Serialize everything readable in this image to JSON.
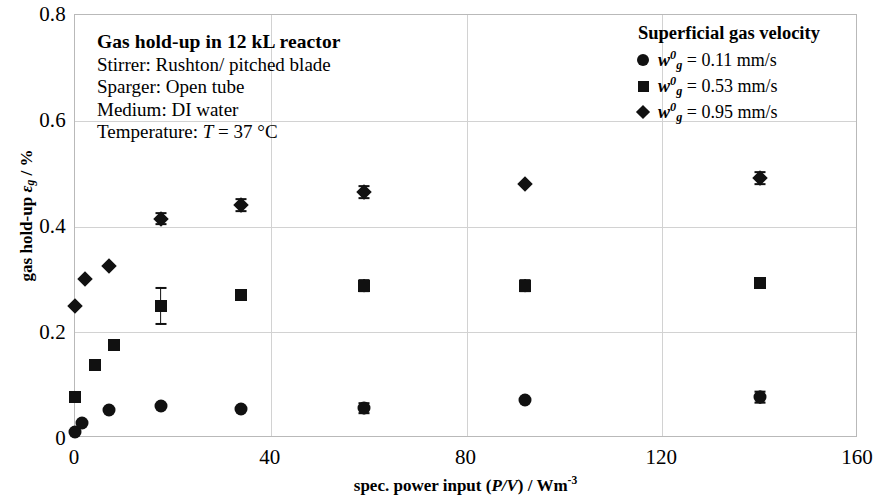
{
  "chart_data": {
    "type": "scatter",
    "title": "Gas hold-up in 12 kL reactor",
    "xlabel": "spec. power input (P/V) / Wm-3",
    "ylabel": "gas hold-up εg / %",
    "xlim": [
      0,
      160
    ],
    "ylim": [
      0,
      0.8
    ],
    "xticks": [
      "0",
      "40",
      "80",
      "120",
      "160"
    ],
    "yticks": [
      "0",
      "0.2",
      "0.4",
      "0.6",
      "0.8"
    ],
    "grid": true,
    "legend_position": "top-right",
    "series": [
      {
        "name": "wg0 = 0.11 mm/s",
        "marker": "circle",
        "color": "#111111",
        "points": [
          {
            "x": 0,
            "y": 0.012,
            "yerr": 0
          },
          {
            "x": 1.5,
            "y": 0.028,
            "yerr": 0
          },
          {
            "x": 7,
            "y": 0.053,
            "yerr": 0
          },
          {
            "x": 17.5,
            "y": 0.06,
            "yerr": 0
          },
          {
            "x": 34,
            "y": 0.054,
            "yerr": 0
          },
          {
            "x": 59,
            "y": 0.056,
            "yerr": 0.011
          },
          {
            "x": 92,
            "y": 0.072,
            "yerr": 0
          },
          {
            "x": 140,
            "y": 0.077,
            "yerr": 0.012
          }
        ]
      },
      {
        "name": "wg0 = 0.53 mm/s",
        "marker": "square",
        "color": "#111111",
        "points": [
          {
            "x": 0,
            "y": 0.078,
            "yerr": 0
          },
          {
            "x": 4,
            "y": 0.138,
            "yerr": 0
          },
          {
            "x": 8,
            "y": 0.175,
            "yerr": 0
          },
          {
            "x": 17.5,
            "y": 0.25,
            "yerr": 0.036
          },
          {
            "x": 34,
            "y": 0.27,
            "yerr": 0
          },
          {
            "x": 59,
            "y": 0.288,
            "yerr": 0.013
          },
          {
            "x": 92,
            "y": 0.288,
            "yerr": 0.013
          },
          {
            "x": 140,
            "y": 0.294,
            "yerr": 0
          }
        ]
      },
      {
        "name": "wg0 = 0.95 mm/s",
        "marker": "diamond",
        "color": "#111111",
        "points": [
          {
            "x": 0,
            "y": 0.25,
            "yerr": 0
          },
          {
            "x": 2,
            "y": 0.3,
            "yerr": 0
          },
          {
            "x": 7,
            "y": 0.325,
            "yerr": 0
          },
          {
            "x": 17.5,
            "y": 0.415,
            "yerr": 0.013
          },
          {
            "x": 34,
            "y": 0.44,
            "yerr": 0.013
          },
          {
            "x": 59,
            "y": 0.465,
            "yerr": 0.013
          },
          {
            "x": 92,
            "y": 0.48,
            "yerr": 0
          },
          {
            "x": 140,
            "y": 0.492,
            "yerr": 0.013
          }
        ]
      }
    ]
  },
  "annotation": {
    "title": "Gas hold-up in 12 kL reactor",
    "stirrer": "Stirrer: Rushton/ pitched blade",
    "sparger": "Sparger: Open tube",
    "medium": "Medium: DI water",
    "temperature_prefix": "Temperature: ",
    "temperature_symbol": "T",
    "temperature_value": " = 37 °C"
  },
  "legend": {
    "title": "Superficial gas velocity",
    "items": [
      {
        "symbol": "w",
        "sup": "0",
        "sub": "g",
        "value": "=  0.11 mm/s",
        "marker": "circle"
      },
      {
        "symbol": "w",
        "sup": "0",
        "sub": "g",
        "value": "=  0.53 mm/s",
        "marker": "square"
      },
      {
        "symbol": "w",
        "sup": "0",
        "sub": "g",
        "value": "=  0.95 mm/s",
        "marker": "diamond"
      }
    ]
  },
  "axes": {
    "x_title_pre": "spec. power input (",
    "x_title_italic": "P/V",
    "x_title_mid": ") / Wm",
    "x_title_sup": "-3",
    "y_title_pre": "gas hold-up ",
    "y_title_eps": "ε",
    "y_title_sub": "g",
    "y_title_post": " / %"
  }
}
